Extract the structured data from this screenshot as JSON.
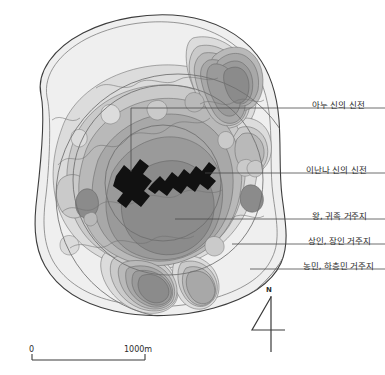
{
  "figure": {
    "type": "archaeological-site-map",
    "background_color": "#ffffff",
    "ink_color": "#2b2b2b"
  },
  "annotations": [
    {
      "key": "anu_temple",
      "label": "아누 신의 신전",
      "text_x": 312,
      "text_y": 100,
      "line_y": 108,
      "line_x_start": 300,
      "line_x_end": 385,
      "leader_elbow_x": 131,
      "leader_elbow_y": 172
    },
    {
      "key": "inanna_temple",
      "label": "이난나 신의 신전",
      "text_x": 312,
      "text_y": 165,
      "line_y": 173,
      "line_x_start": 205,
      "line_x_end": 385
    },
    {
      "key": "royal_noble",
      "label": "왕, 귀족 거주지",
      "text_x": 312,
      "text_y": 211,
      "line_y": 219,
      "line_x_start": 175,
      "line_x_end": 385
    },
    {
      "key": "merchant_artisan",
      "label": "상인, 장인 거주지",
      "text_x": 312,
      "text_y": 236,
      "line_y": 244,
      "line_x_start": 232,
      "line_x_end": 385
    },
    {
      "key": "farmer_lower",
      "label": "농민, 하층민 거주지",
      "text_x": 312,
      "text_y": 261,
      "line_y": 269,
      "line_x_start": 250,
      "line_x_end": 385
    }
  ],
  "scale_bar": {
    "start_label": "0",
    "end_label": "1000m",
    "x_start": 32,
    "x_end": 145,
    "y": 360,
    "tick_height": 6,
    "start_label_x": 29,
    "end_label_x": 124,
    "label_y": 349
  },
  "north_arrow": {
    "label": "N",
    "label_x": 266,
    "label_y": 289,
    "shaft_x": 271,
    "shaft_top": 296,
    "shaft_bottom": 352,
    "stroke": "#3a3a3a"
  },
  "zones": {
    "outer_boundary_stroke": "#404040",
    "circle_stroke": "#6e6e6e",
    "tone_lightest": "#efefef",
    "tone_light": "#dcdcdc",
    "tone_mid_light": "#cacaca",
    "tone_mid": "#b9b9b9",
    "tone_mid_dark": "#a8a8a8",
    "tone_dark": "#9a9a9a",
    "tone_darkest": "#8b8b8b",
    "building_fill": "#111111"
  },
  "rings": [
    {
      "name": "outer-residential-ring",
      "cx": 178,
      "cy": 196,
      "r": 122
    },
    {
      "name": "middle-residential-ring",
      "cx": 168,
      "cy": 180,
      "r": 95
    },
    {
      "name": "inner-elite-ring",
      "cx": 163,
      "cy": 183,
      "r": 58
    }
  ]
}
